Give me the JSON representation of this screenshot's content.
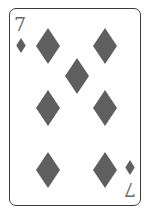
{
  "card": {
    "rank": "7",
    "suit": "diamonds",
    "suit_icon": "diamond-icon",
    "pip_color": "#5f5f5f",
    "index_color": "#6a6a6a",
    "border_color": "#3a3a3a",
    "pip_count": 7
  }
}
